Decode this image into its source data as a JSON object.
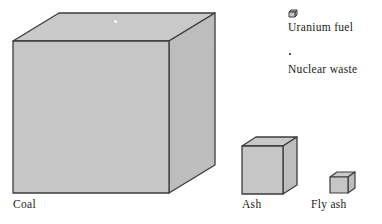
{
  "figure": {
    "background_color": "#ffffff",
    "cube_face_color": "#c6c6c6",
    "cube_top_color": "#c9c9c9",
    "cube_side_color": "#bdbdbd",
    "cube_edge_color": "#3c3c3c",
    "text_color": "#1a1a1a"
  },
  "cubes": [
    {
      "name": "coal",
      "label": "Coal",
      "front_width": 154,
      "front_height": 152,
      "depth_x": 46,
      "depth_y": 28
    },
    {
      "name": "ash",
      "label": "Ash",
      "front_width": 41,
      "front_height": 48,
      "depth_x": 14,
      "depth_y": 9
    },
    {
      "name": "fly-ash",
      "label": "Fly ash",
      "front_width": 18,
      "front_height": 16,
      "depth_x": 7,
      "depth_y": 5
    }
  ],
  "legend": {
    "items": [
      {
        "name": "uranium-fuel",
        "label": "Uranium fuel",
        "marker": "tiny-cube-icon",
        "marker_size_px": 5
      },
      {
        "name": "nuclear-waste",
        "label": "Nuclear waste",
        "marker": "dot-icon",
        "marker_size_px": 2
      }
    ]
  },
  "markers": {
    "uranium_speck_on_coal": {
      "name": "uranium-fuel-speck",
      "size_px": 3
    }
  }
}
